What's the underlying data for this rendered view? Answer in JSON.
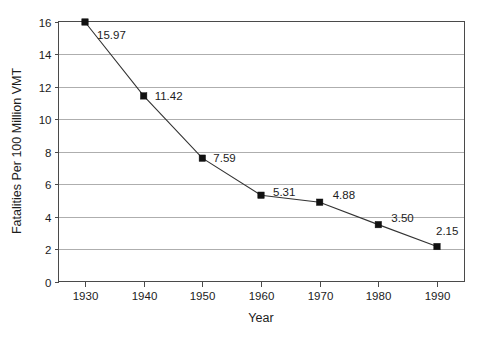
{
  "chart_data": {
    "type": "line",
    "title": "",
    "xlabel": "Year",
    "ylabel": "Fatalities Per 100 Million VMT",
    "x": [
      1930,
      1940,
      1950,
      1960,
      1970,
      1980,
      1990
    ],
    "values": [
      15.97,
      11.42,
      7.59,
      5.31,
      4.88,
      3.5,
      2.15
    ],
    "point_labels": [
      "15.97",
      "11.42",
      "7.59",
      "5.31",
      "4.88",
      "3.50",
      "2.15"
    ],
    "xtick_labels": [
      "1930",
      "1940",
      "1950",
      "1960",
      "1970",
      "1980",
      "1990"
    ],
    "ytick_labels": [
      "0",
      "2",
      "4",
      "6",
      "8",
      "10",
      "12",
      "14",
      "16"
    ],
    "yticks": [
      0,
      2,
      4,
      6,
      8,
      10,
      12,
      14,
      16
    ],
    "xlim": [
      1925,
      1995
    ],
    "ylim": [
      0,
      16
    ],
    "grid": "horizontal",
    "legend": "none",
    "marker": "square",
    "colors": {
      "line": "#333333",
      "marker": "#111111",
      "grid": "#9a9a9a",
      "axis": "#4a4a4a",
      "text": "#1c1c1c",
      "background": "#ffffff"
    }
  }
}
